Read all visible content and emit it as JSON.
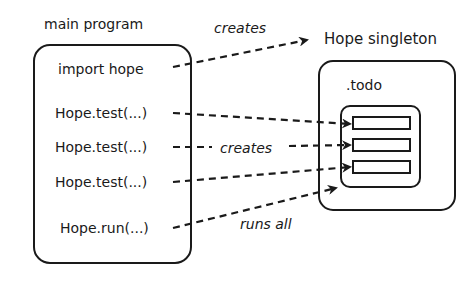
{
  "main_program": {
    "title": "main program",
    "lines": [
      "import hope",
      "Hope.test(...)",
      "Hope.test(...)",
      "Hope.test(...)",
      "Hope.run(...)"
    ]
  },
  "singleton": {
    "title": "Hope singleton",
    "todo_label": ".todo",
    "todo_items_count": 3
  },
  "arrows": {
    "import_label": "creates",
    "test_label": "creates",
    "run_label": "runs all"
  },
  "colors": {
    "stroke": "#1a1a1a",
    "background": "#ffffff"
  }
}
